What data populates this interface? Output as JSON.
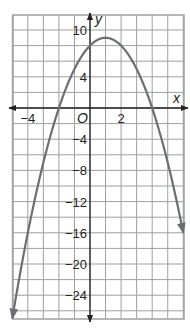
{
  "chart_data": {
    "type": "line",
    "title": "",
    "xlabel": "x",
    "ylabel": "y",
    "origin_label": "O",
    "xlim": [
      -5,
      6
    ],
    "ylim": [
      -27,
      12
    ],
    "grid": true,
    "x_ticks": [
      {
        "value": -4,
        "label": "−4"
      },
      {
        "value": 2,
        "label": "2"
      }
    ],
    "y_ticks": [
      {
        "value": 10,
        "label": "10"
      },
      {
        "value": 4,
        "label": "4"
      },
      {
        "value": -4,
        "label": "−4"
      },
      {
        "value": -8,
        "label": "−8"
      },
      {
        "value": -12,
        "label": "−12"
      },
      {
        "value": -16,
        "label": "−16"
      },
      {
        "value": -20,
        "label": "−20"
      },
      {
        "value": -24,
        "label": "−24"
      }
    ],
    "series": [
      {
        "name": "parabola",
        "equation": "y = -x^2 + 2x + 8",
        "vertex": [
          1,
          9
        ],
        "x_intercepts": [
          -2,
          4
        ],
        "y_intercept": 8,
        "x": [
          -5,
          -4,
          -3,
          -2,
          -1,
          0,
          1,
          2,
          3,
          4,
          5,
          6
        ],
        "y": [
          -27,
          -16,
          -7,
          0,
          5,
          8,
          9,
          8,
          5,
          0,
          -7,
          -16
        ],
        "color": "#6d6e71",
        "arrows_on_ends": true
      }
    ]
  },
  "colors": {
    "grid": "#9d9fa2",
    "axis": "#231f20",
    "curve": "#6d6e71",
    "text": "#231f20"
  }
}
